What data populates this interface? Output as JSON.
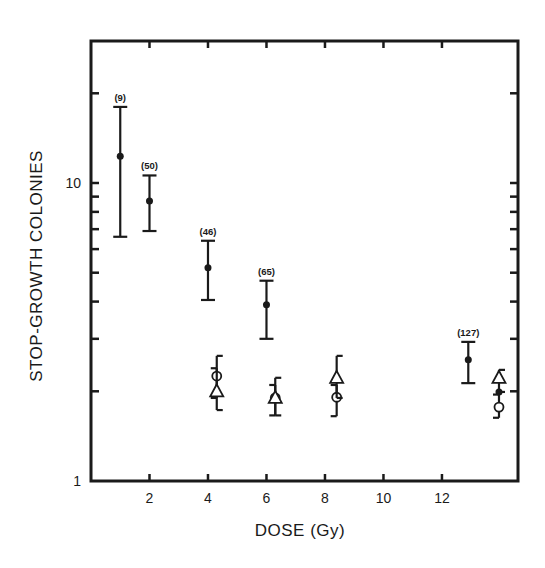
{
  "chart_data": {
    "type": "scatter",
    "title": "",
    "xlabel": "DOSE (Gy)",
    "ylabel": "STOP-GROWTH COLONIES",
    "xscale": "linear",
    "yscale": "log",
    "xlim": [
      0,
      14.6
    ],
    "ylim": [
      1,
      30
    ],
    "x_ticks": [
      2,
      4,
      6,
      8,
      10,
      12
    ],
    "x_tick_labels": [
      "2",
      "4",
      "6",
      "8",
      "10",
      "12"
    ],
    "y_tick_labels": [
      {
        "value": 1,
        "label": "1"
      },
      {
        "value": 10,
        "label": "10"
      }
    ],
    "y_minor_ticks": [
      2,
      3,
      4,
      5,
      6,
      7,
      8,
      9,
      20
    ],
    "grid": false,
    "legend": null,
    "series": [
      {
        "name": "filled circles",
        "marker": "filled-circle",
        "points": [
          {
            "x": 1.0,
            "y": 12.3,
            "y_low": 6.6,
            "y_high": 18.0,
            "annotation": "(9)"
          },
          {
            "x": 2.0,
            "y": 8.7,
            "y_low": 6.9,
            "y_high": 10.6,
            "annotation": "(50)"
          },
          {
            "x": 4.0,
            "y": 5.2,
            "y_low": 4.05,
            "y_high": 6.4,
            "annotation": "(46)"
          },
          {
            "x": 6.0,
            "y": 3.9,
            "y_low": 3.0,
            "y_high": 4.7,
            "annotation": "(65)"
          },
          {
            "x": 12.9,
            "y": 2.55,
            "y_low": 2.13,
            "y_high": 2.93,
            "annotation": "(127)"
          },
          {
            "x": 13.95,
            "y": 1.99,
            "y_low": null,
            "y_high": null,
            "annotation": ""
          }
        ]
      },
      {
        "name": "open circles",
        "marker": "open-circle",
        "points": [
          {
            "x": 4.3,
            "y": 2.25,
            "y_low": 1.9,
            "y_high": 2.39
          },
          {
            "x": 6.3,
            "y": 1.9,
            "y_low": 1.66,
            "y_high": 2.1
          },
          {
            "x": 8.4,
            "y": 1.91,
            "y_low": 1.65,
            "y_high": 2.1
          },
          {
            "x": 13.95,
            "y": 1.77,
            "y_low": 1.63,
            "y_high": 1.95
          }
        ]
      },
      {
        "name": "open triangles",
        "marker": "open-triangle",
        "points": [
          {
            "x": 4.3,
            "y": 2.0,
            "y_low": 1.73,
            "y_high": 2.63
          },
          {
            "x": 6.3,
            "y": 1.9,
            "y_low": 1.66,
            "y_high": 2.22
          },
          {
            "x": 8.4,
            "y": 2.22,
            "y_low": 1.9,
            "y_high": 2.63
          },
          {
            "x": 13.95,
            "y": 2.22,
            "y_low": 1.99,
            "y_high": 2.36
          }
        ]
      }
    ]
  },
  "colors": {
    "ink": "#1a1a1a",
    "background": "#ffffff"
  }
}
